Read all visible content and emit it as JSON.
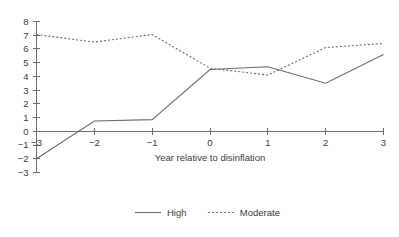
{
  "chart_data": {
    "type": "line",
    "title": "",
    "xlabel": "Year relative to disinflation",
    "ylabel": "",
    "x": [
      -3,
      -2,
      -1,
      0,
      1,
      2,
      3
    ],
    "xtick_labels": [
      "−3",
      "−2",
      "−1",
      "0",
      "1",
      "2",
      "3"
    ],
    "ytick_labels": [
      "−3",
      "−2",
      "−1",
      "0",
      "1",
      "2",
      "3",
      "4",
      "5",
      "6",
      "7",
      "8"
    ],
    "yticks": [
      -3,
      -2,
      -1,
      0,
      1,
      2,
      3,
      4,
      5,
      6,
      7,
      8
    ],
    "xlim": [
      -3,
      3
    ],
    "ylim": [
      -3,
      8
    ],
    "grid": false,
    "legend_position": "bottom-center",
    "series": [
      {
        "name": "High",
        "style": "solid",
        "color": "#6b6b6b",
        "values": [
          -2.0,
          0.75,
          0.85,
          4.5,
          4.7,
          3.5,
          5.6
        ]
      },
      {
        "name": "Moderate",
        "style": "dotted",
        "color": "#6b6b6b",
        "values": [
          7.05,
          6.5,
          7.05,
          4.6,
          4.1,
          6.1,
          6.4
        ]
      }
    ]
  },
  "legend": {
    "entries": [
      {
        "label": "High",
        "style": "solid"
      },
      {
        "label": "Moderate",
        "style": "dotted"
      }
    ]
  }
}
